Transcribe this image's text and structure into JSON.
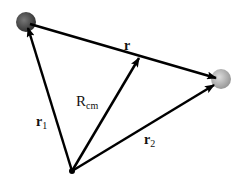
{
  "diagram": {
    "particles": [
      {
        "id": "particle-1",
        "color": "#555555"
      },
      {
        "id": "particle-2",
        "color": "#bbbbbb"
      }
    ],
    "labels": {
      "r": "r",
      "r1_main": "r",
      "r1_sub": "1",
      "r2_main": "r",
      "r2_sub": "2",
      "rcm_main": "R",
      "rcm_sub": "cm"
    }
  }
}
